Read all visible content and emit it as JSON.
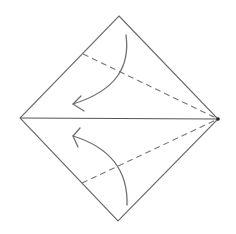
{
  "diagram": {
    "type": "origami-fold-step",
    "background": "#ffffff",
    "colors": {
      "edge": "#6a6a6a",
      "centerline": "#555555",
      "valley_fold": "#777777",
      "arrow": "#707070",
      "vertex_dot": "#222222"
    },
    "square": {
      "top": [
        119,
        16
      ],
      "right": [
        218,
        119
      ],
      "bottom": [
        118,
        221
      ],
      "left": [
        20,
        118
      ]
    },
    "centerline": {
      "from": [
        20,
        118
      ],
      "to": [
        218,
        119
      ]
    },
    "folds": [
      {
        "name": "upper-valley-fold",
        "from": [
          83,
          54
        ],
        "to": [
          218,
          119
        ],
        "style": "dashed"
      },
      {
        "name": "lower-valley-fold",
        "from": [
          82,
          183
        ],
        "to": [
          218,
          119
        ],
        "style": "dashed"
      }
    ],
    "arrows": [
      {
        "name": "upper-fold-arrow",
        "path": "M126 35 C 130 65, 118 90, 73 104",
        "head": [
          [
            81,
            96
          ],
          [
            73,
            104
          ],
          [
            84,
            111
          ]
        ]
      },
      {
        "name": "lower-fold-arrow",
        "path": "M127 205 C 128 172, 112 148, 73 136",
        "head": [
          [
            80,
            128
          ],
          [
            73,
            136
          ],
          [
            78,
            147
          ]
        ]
      }
    ]
  }
}
